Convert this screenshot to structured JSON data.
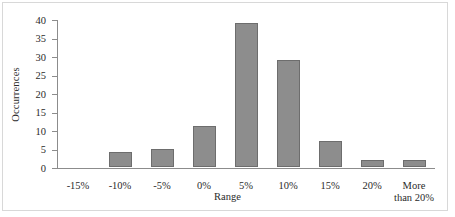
{
  "chart_data": {
    "type": "bar",
    "title": "",
    "xlabel": "Range",
    "ylabel": "Occurrences",
    "categories": [
      "-15%",
      "-10%",
      "-5%",
      "0%",
      "5%",
      "10%",
      "15%",
      "20%",
      "More than 20%"
    ],
    "values": [
      0,
      4,
      5,
      11,
      39,
      29,
      7,
      2,
      2
    ],
    "ylim": [
      0,
      40
    ],
    "yticks": [
      0,
      5,
      10,
      15,
      20,
      25,
      30,
      35,
      40
    ],
    "ytick_labels": [
      "0",
      "5",
      "10",
      "15",
      "20",
      "25",
      "30",
      "35",
      "40"
    ],
    "grid": false,
    "legend": false,
    "bar_color": "#8d8d8d",
    "bar_border_color": "#6d6d6d",
    "axis_color": "#8c8c8c",
    "text_color": "#2b2b2b",
    "frame_color": "#d8d8d8",
    "background": "#ffffff"
  }
}
